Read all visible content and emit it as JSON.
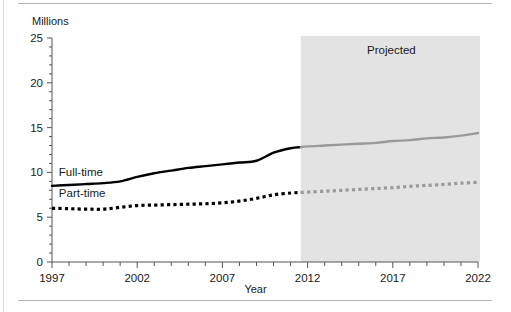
{
  "chart_data": {
    "type": "line",
    "title": "",
    "xlabel": "Year",
    "ylabel": "Millions",
    "ylabel_position": "top-left",
    "xlim": [
      1997,
      2022
    ],
    "ylim": [
      0,
      25
    ],
    "grid": false,
    "legend": "inline-labels",
    "y_ticks_major": [
      0,
      5,
      10,
      15,
      20,
      25
    ],
    "y_tick_interval_minor": 1,
    "x_ticks_major": [
      1997,
      2002,
      2007,
      2012,
      2017,
      2022
    ],
    "x_tick_interval_minor": 1,
    "x_tick_labels": [
      "1997",
      "2002",
      "2007",
      "2012",
      "2017",
      "2022"
    ],
    "y_tick_labels": [
      "0",
      "5",
      "10",
      "15",
      "20",
      "25"
    ],
    "annotations": [
      {
        "text": "Projected",
        "type": "shaded-region-label",
        "region_start_year": 2011.6,
        "region_end_year": 2022,
        "region_color": "#e3e3e3"
      }
    ],
    "series": [
      {
        "name": "Full-time",
        "style": "solid",
        "color_actual": "#000000",
        "color_projected": "#9a9a9a",
        "label_x_year": 1997.4,
        "label_y_value": 9.6,
        "x": [
          1997,
          1998,
          1999,
          2000,
          2001,
          2002,
          2003,
          2004,
          2005,
          2006,
          2007,
          2008,
          2009,
          2010,
          2011,
          2012,
          2013,
          2014,
          2015,
          2016,
          2017,
          2018,
          2019,
          2020,
          2021,
          2022
        ],
        "values": [
          8.5,
          8.6,
          8.7,
          8.8,
          9.0,
          9.5,
          9.9,
          10.2,
          10.5,
          10.7,
          10.9,
          11.1,
          11.3,
          12.2,
          12.7,
          12.9,
          13.0,
          13.1,
          13.2,
          13.3,
          13.5,
          13.6,
          13.8,
          13.9,
          14.1,
          14.4
        ]
      },
      {
        "name": "Part-time",
        "style": "dotted",
        "color_actual": "#000000",
        "color_projected": "#9a9a9a",
        "label_x_year": 1997.4,
        "label_y_value": 7.3,
        "x": [
          1997,
          1998,
          1999,
          2000,
          2001,
          2002,
          2003,
          2004,
          2005,
          2006,
          2007,
          2008,
          2009,
          2010,
          2011,
          2012,
          2013,
          2014,
          2015,
          2016,
          2017,
          2018,
          2019,
          2020,
          2021,
          2022
        ],
        "values": [
          6.0,
          5.95,
          5.9,
          5.9,
          6.1,
          6.3,
          6.35,
          6.4,
          6.45,
          6.5,
          6.6,
          6.8,
          7.1,
          7.5,
          7.7,
          7.8,
          7.9,
          8.0,
          8.1,
          8.2,
          8.3,
          8.45,
          8.55,
          8.65,
          8.8,
          8.9
        ]
      }
    ]
  },
  "labels": {
    "y_axis_title": "Millions",
    "x_axis_title": "Year",
    "projected_label": "Projected",
    "series_fulltime": "Full-time",
    "series_parttime": "Part-time"
  },
  "colors": {
    "line_actual": "#000000",
    "line_projected": "#9a9a9a",
    "projected_band": "#e3e3e3",
    "axis": "#555555",
    "rule": "#b5b5b5",
    "text": "#1a1a1a"
  }
}
